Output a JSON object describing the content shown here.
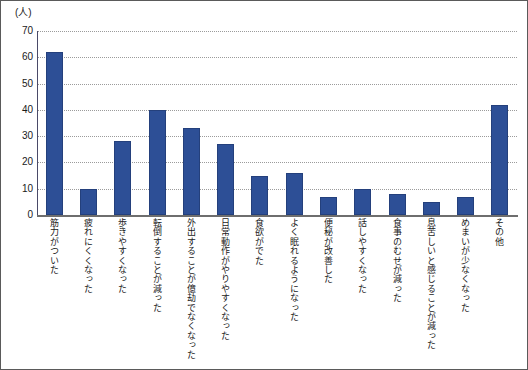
{
  "chart_data": {
    "type": "bar",
    "title": "",
    "subtitle": "",
    "xlabel": "",
    "ylabel": "",
    "unit_label": "(人)",
    "ylim": [
      0,
      70
    ],
    "yticks": [
      70,
      60,
      50,
      40,
      30,
      20,
      10,
      0
    ],
    "grid": true,
    "legend": "none",
    "bar_color": "#2d4f96",
    "bar_edge_color": "#24407c",
    "axis_color": "#6e6e6e",
    "grid_color": "#9b9b9b",
    "categories": [
      "筋力がついた",
      "疲れにくくなった",
      "歩きやすくなった",
      "転倒することが減った",
      "外出することが億劫でなくなった",
      "日常動作がやりやすくなった",
      "食欲がでた",
      "よく眠れるようになった",
      "便秘が改善した",
      "話しやすくなった",
      "食事のむせが減った",
      "息苦しいと感じることが減った",
      "めまいが少なくなった",
      "その他"
    ],
    "values": [
      62,
      10,
      28,
      40,
      33,
      27,
      15,
      16,
      7,
      10,
      8,
      5,
      7,
      42
    ]
  }
}
